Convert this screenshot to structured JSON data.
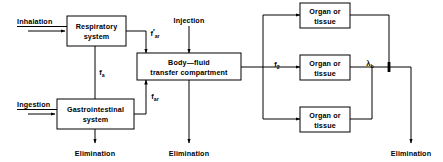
{
  "diagram": {
    "ink_color": "#000000",
    "background_color": "#ffffff",
    "boxes": {
      "respiratory": {
        "line1": "Respiratory",
        "line2": "system"
      },
      "gastrointestinal": {
        "line1": "Gastrointestinal",
        "line2": "system"
      },
      "body_fluid": {
        "line1": "Body—fluid",
        "line2": "transfer  compartment"
      },
      "organ_top": {
        "line1": "Organ  or",
        "line2": "tissue"
      },
      "organ_middle": {
        "line1": "Organ  or",
        "line2": "tissue"
      },
      "organ_bottom": {
        "line1": "Organ  or",
        "line2": "tissue"
      }
    },
    "inputs": {
      "inhalation": "Inhalation",
      "ingestion": "Ingestion",
      "injection": "Injection"
    },
    "outputs": {
      "elimination_gi": "Elimination",
      "elimination_body_fluid": "Elimination",
      "elimination_organs": "Elimination"
    },
    "flow_labels": {
      "f_ar_prime": {
        "base": "f",
        "prime": "′",
        "sub": "ar"
      },
      "f_a": {
        "base": "f",
        "prime": "",
        "sub": "a"
      },
      "f_ar": {
        "base": "f",
        "prime": "",
        "sub": "ar"
      },
      "f_2": {
        "base": "f",
        "prime": "",
        "sub": "2"
      },
      "lambda_b": {
        "base": "λ",
        "prime": "",
        "sub": "b"
      }
    }
  }
}
